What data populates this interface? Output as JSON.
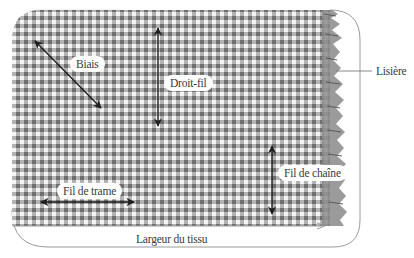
{
  "diagram": {
    "labels": {
      "bias": "Biais",
      "straight_grain": "Droit-fil",
      "selvage": "Lisière",
      "weft": "Fil de trame",
      "warp": "Fil de chaîne",
      "fabric_width": "Largeur du tissu"
    },
    "colors": {
      "check_dark": "#6e6e6e",
      "check_mid": "#a8a8a8",
      "check_light": "#f4f4f4",
      "frame": "#9a9a9a",
      "arrow": "#1e1e1e",
      "text": "#3a3a3a"
    }
  }
}
